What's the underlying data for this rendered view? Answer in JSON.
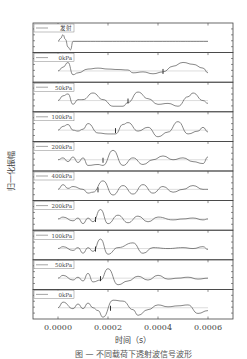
{
  "chart_data": {
    "type": "line",
    "layout": "stacked-panels",
    "xlabel": "时间（s）",
    "ylabel": "归一化振幅",
    "xlim": [
      -0.0001,
      0.0007
    ],
    "xticks": [
      0.0,
      0.0002,
      0.0004,
      0.0006
    ],
    "xtick_labels": [
      "0.0000",
      "0.0002",
      "0.0004",
      "0.0006"
    ],
    "ylim": [
      -1,
      1
    ],
    "legend_position": "top-left of each panel",
    "series": [
      {
        "name": "发射",
        "marker_t": null,
        "points": [
          [
            0.0,
            0
          ],
          [
            1e-05,
            0.3
          ],
          [
            2e-05,
            0.7
          ],
          [
            3e-05,
            0.2
          ],
          [
            4e-05,
            -0.6
          ],
          [
            5e-05,
            -0.9
          ],
          [
            6e-05,
            0
          ],
          [
            0.0001,
            0
          ],
          [
            0.0002,
            0
          ],
          [
            0.0004,
            0
          ],
          [
            0.0006,
            0
          ]
        ]
      },
      {
        "name": "0kPa",
        "marker_t": 0.00042,
        "points": [
          [
            0.0,
            0
          ],
          [
            2e-05,
            0.4
          ],
          [
            4e-05,
            0.9
          ],
          [
            6e-05,
            -0.4
          ],
          [
            8e-05,
            -0.2
          ],
          [
            0.00012,
            0.2
          ],
          [
            0.00016,
            0.3
          ],
          [
            0.0002,
            0.2
          ],
          [
            0.00024,
            0.15
          ],
          [
            0.00028,
            0.1
          ],
          [
            0.0003,
            -0.2
          ],
          [
            0.00034,
            -0.1
          ],
          [
            0.00038,
            -0.3
          ],
          [
            0.00042,
            -0.1
          ],
          [
            0.00046,
            0.5
          ],
          [
            0.0005,
            0.9
          ],
          [
            0.00054,
            0.7
          ],
          [
            0.00058,
            0.3
          ],
          [
            0.0006,
            -0.2
          ]
        ]
      },
      {
        "name": "50kPa",
        "marker_t": 0.00028,
        "points": [
          [
            0.0,
            0
          ],
          [
            2e-05,
            0.5
          ],
          [
            4e-05,
            0.7
          ],
          [
            6e-05,
            -0.4
          ],
          [
            8e-05,
            0.1
          ],
          [
            0.0001,
            0.1
          ],
          [
            0.00014,
            0.8
          ],
          [
            0.00018,
            0.1
          ],
          [
            0.00022,
            -0.6
          ],
          [
            0.00026,
            -0.6
          ],
          [
            0.00028,
            -0.2
          ],
          [
            0.00032,
            0.9
          ],
          [
            0.00036,
            0.2
          ],
          [
            0.0004,
            -0.4
          ],
          [
            0.00044,
            -0.3
          ],
          [
            0.00048,
            -0.6
          ],
          [
            0.00052,
            0.4
          ],
          [
            0.00054,
            0.8
          ],
          [
            0.00058,
            0
          ],
          [
            0.0006,
            -0.3
          ]
        ]
      },
      {
        "name": "100kPa",
        "marker_t": 0.00023,
        "points": [
          [
            0.0,
            0
          ],
          [
            2e-05,
            0.4
          ],
          [
            4e-05,
            0.6
          ],
          [
            6e-05,
            0
          ],
          [
            8e-05,
            -0.1
          ],
          [
            0.0001,
            0.1
          ],
          [
            0.00012,
            0.7
          ],
          [
            0.00016,
            -0.3
          ],
          [
            0.0002,
            -0.4
          ],
          [
            0.00023,
            -0.4
          ],
          [
            0.00026,
            0.6
          ],
          [
            0.00028,
            0.8
          ],
          [
            0.00032,
            -0.1
          ],
          [
            0.00036,
            0.3
          ],
          [
            0.0004,
            -0.7
          ],
          [
            0.00044,
            -0.2
          ],
          [
            0.00048,
            0.9
          ],
          [
            0.00052,
            -0.4
          ],
          [
            0.00056,
            -0.1
          ],
          [
            0.00058,
            0.3
          ],
          [
            0.0006,
            -0.2
          ]
        ]
      },
      {
        "name": "200kPa",
        "marker_t": 0.00018,
        "points": [
          [
            0.0,
            0
          ],
          [
            2e-05,
            0.2
          ],
          [
            4e-05,
            -0.2
          ],
          [
            6e-05,
            0.3
          ],
          [
            8e-05,
            -0.3
          ],
          [
            0.0001,
            0.2
          ],
          [
            0.00012,
            -0.6
          ],
          [
            0.00016,
            -0.5
          ],
          [
            0.00018,
            -0.6
          ],
          [
            0.00022,
            1.0
          ],
          [
            0.00026,
            -0.6
          ],
          [
            0.0003,
            0.2
          ],
          [
            0.00034,
            -0.5
          ],
          [
            0.00038,
            0
          ],
          [
            0.00042,
            0.4
          ],
          [
            0.00046,
            0
          ],
          [
            0.0005,
            0.2
          ],
          [
            0.00054,
            -0.2
          ],
          [
            0.00058,
            -0.4
          ],
          [
            0.0006,
            0.3
          ]
        ]
      },
      {
        "name": "400kPa",
        "marker_t": 0.00016,
        "points": [
          [
            0.0,
            0
          ],
          [
            2e-05,
            0.5
          ],
          [
            4e-05,
            0.1
          ],
          [
            6e-05,
            0.3
          ],
          [
            0.0001,
            0
          ],
          [
            0.00012,
            -0.4
          ],
          [
            0.00014,
            -0.3
          ],
          [
            0.00018,
            0.9
          ],
          [
            0.00022,
            -0.6
          ],
          [
            0.00026,
            0.4
          ],
          [
            0.0003,
            -0.5
          ],
          [
            0.00034,
            0.5
          ],
          [
            0.00038,
            -0.4
          ],
          [
            0.00042,
            0.3
          ],
          [
            0.00046,
            -0.3
          ],
          [
            0.0005,
            0
          ],
          [
            0.00054,
            0.4
          ],
          [
            0.00058,
            0
          ],
          [
            0.0006,
            0
          ]
        ]
      },
      {
        "name": "200kPa",
        "marker_t": 0.00015,
        "points": [
          [
            0.0,
            0
          ],
          [
            2e-05,
            0.2
          ],
          [
            6e-05,
            -0.2
          ],
          [
            8e-05,
            0.1
          ],
          [
            0.0001,
            -0.5
          ],
          [
            0.00012,
            0.1
          ],
          [
            0.00014,
            -0.3
          ],
          [
            0.00017,
            1.0
          ],
          [
            0.0002,
            -0.5
          ],
          [
            0.00024,
            0.4
          ],
          [
            0.00028,
            -0.4
          ],
          [
            0.00032,
            0.3
          ],
          [
            0.00036,
            -0.3
          ],
          [
            0.0004,
            0.2
          ],
          [
            0.00046,
            -0.1
          ],
          [
            0.0005,
            0
          ],
          [
            0.00054,
            0.1
          ],
          [
            0.00058,
            -0.1
          ],
          [
            0.0006,
            0
          ]
        ]
      },
      {
        "name": "100kPa",
        "marker_t": 0.00015,
        "points": [
          [
            0.0,
            0
          ],
          [
            2e-05,
            0.2
          ],
          [
            6e-05,
            -0.2
          ],
          [
            8e-05,
            0.1
          ],
          [
            0.0001,
            -0.5
          ],
          [
            0.00012,
            0.1
          ],
          [
            0.00014,
            -0.3
          ],
          [
            0.00017,
            1.0
          ],
          [
            0.0002,
            -0.6
          ],
          [
            0.00024,
            0.1
          ],
          [
            0.0003,
            0.6
          ],
          [
            0.00034,
            -0.5
          ],
          [
            0.00038,
            0.1
          ],
          [
            0.00044,
            0
          ],
          [
            0.0005,
            0.1
          ],
          [
            0.00054,
            0
          ],
          [
            0.00058,
            0.2
          ],
          [
            0.0006,
            -0.1
          ]
        ]
      },
      {
        "name": "50kPa",
        "marker_t": 0.00017,
        "points": [
          [
            0.0,
            0
          ],
          [
            2e-05,
            0.3
          ],
          [
            6e-05,
            -0.2
          ],
          [
            8e-05,
            0.1
          ],
          [
            0.0001,
            -0.3
          ],
          [
            0.00012,
            0.5
          ],
          [
            0.00014,
            -0.4
          ],
          [
            0.00017,
            -0.2
          ],
          [
            0.0002,
            1.0
          ],
          [
            0.00024,
            -0.7
          ],
          [
            0.00028,
            -0.3
          ],
          [
            0.00032,
            0.2
          ],
          [
            0.00036,
            -0.2
          ],
          [
            0.0004,
            0.3
          ],
          [
            0.00044,
            -0.1
          ],
          [
            0.00048,
            0
          ],
          [
            0.00052,
            0.1
          ],
          [
            0.00056,
            -0.1
          ],
          [
            0.0006,
            0
          ]
        ]
      },
      {
        "name": "0kPa",
        "marker_t": 0.00021,
        "points": [
          [
            0.0,
            0
          ],
          [
            2e-05,
            0.6
          ],
          [
            6e-05,
            -0.1
          ],
          [
            8e-05,
            0.4
          ],
          [
            0.0001,
            -0.1
          ],
          [
            0.00012,
            0.5
          ],
          [
            0.00014,
            0
          ],
          [
            0.00016,
            -0.3
          ],
          [
            0.00018,
            -1.0
          ],
          [
            0.00022,
            0.8
          ],
          [
            0.00026,
            0.7
          ],
          [
            0.0003,
            -0.2
          ],
          [
            0.00032,
            -0.8
          ],
          [
            0.00036,
            -0.2
          ],
          [
            0.0004,
            0.3
          ],
          [
            0.00044,
            0.1
          ],
          [
            0.00048,
            0.2
          ],
          [
            0.00052,
            0.3
          ],
          [
            0.00056,
            -0.6
          ],
          [
            0.0006,
            -0.3
          ]
        ]
      }
    ]
  },
  "caption": "图 — 不同载荷下透射波信号波形"
}
